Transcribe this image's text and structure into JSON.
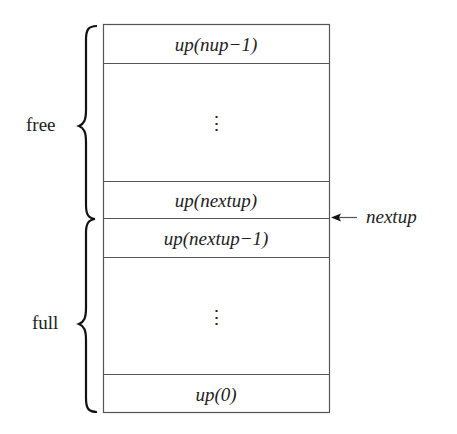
{
  "diagram": {
    "type": "stack-memory-layout",
    "cells": [
      {
        "label": "up(nup−1)",
        "kind": "slot"
      },
      {
        "label": "⋮",
        "kind": "ellipsis"
      },
      {
        "label": "up(nextup)",
        "kind": "slot"
      },
      {
        "label": "up(nextup−1)",
        "kind": "slot"
      },
      {
        "label": "⋮",
        "kind": "ellipsis"
      },
      {
        "label": "up(0)",
        "kind": "slot"
      }
    ],
    "groups": [
      {
        "label": "free",
        "spans": "up(nup−1) to up(nextup)"
      },
      {
        "label": "full",
        "spans": "up(nextup−1) to up(0)"
      }
    ],
    "pointer": {
      "label": "nextup",
      "points_to": "boundary between up(nextup) and up(nextup−1)"
    },
    "colors": {
      "line": "#555555",
      "text": "#222222",
      "background": "#ffffff"
    }
  }
}
